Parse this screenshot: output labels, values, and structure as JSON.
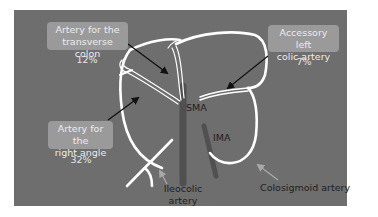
{
  "diagram": {
    "type": "anatomical",
    "colors": {
      "page_background": "#ffffff",
      "panel_background": "#6e6e6e",
      "label_box": "#9a9a9a",
      "label_text": "#ececec",
      "vessel": "#ffffff",
      "trunk": "#505050",
      "pointer_arrow_dark": "#111111",
      "pointer_arrow_light": "#a8a8a8",
      "dark_text": "#1e1e1e"
    },
    "callouts": [
      {
        "id": "transverse",
        "line1": "Artery for the",
        "line2": "transverse colon",
        "percent": "12%"
      },
      {
        "id": "accessory",
        "line1": "Accessory left",
        "line2": "colic artery",
        "percent": "7%"
      },
      {
        "id": "right-angle",
        "line1": "Artery for the",
        "line2": "right angle",
        "percent": "32%"
      }
    ],
    "trunk_labels": {
      "sma": "SMA",
      "ima": "IMA"
    },
    "bottom_labels": {
      "ileocolic_line1": "Ileocolic",
      "ileocolic_line2": "artery",
      "colosigmoid": "Colosigmoid artery"
    }
  }
}
